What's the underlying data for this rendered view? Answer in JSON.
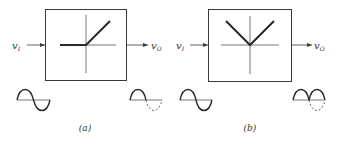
{
  "colors": {
    "stroke": "#3a3a3a",
    "thick": "#2a2a2a",
    "axis": "#555555",
    "dashed": "#666666",
    "background": "#ffffff"
  },
  "panels": [
    {
      "id": "a",
      "caption": "(a)",
      "input_label": {
        "base": "v",
        "sub": "I"
      },
      "output_label": {
        "base": "v",
        "sub": "O"
      },
      "transfer_characteristic": "half-wave rectifier (zero for negative input, linear for positive input)",
      "input_waveform": "sine",
      "output_waveform": "half-wave rectified sine (negative half shown dashed)"
    },
    {
      "id": "b",
      "caption": "(b)",
      "input_label": {
        "base": "v",
        "sub": "I"
      },
      "output_label": {
        "base": "v",
        "sub": "O"
      },
      "transfer_characteristic": "full-wave rectifier (V-shaped, absolute value)",
      "input_waveform": "sine",
      "output_waveform": "full-wave rectified sine (original negative half shown dashed)"
    }
  ]
}
